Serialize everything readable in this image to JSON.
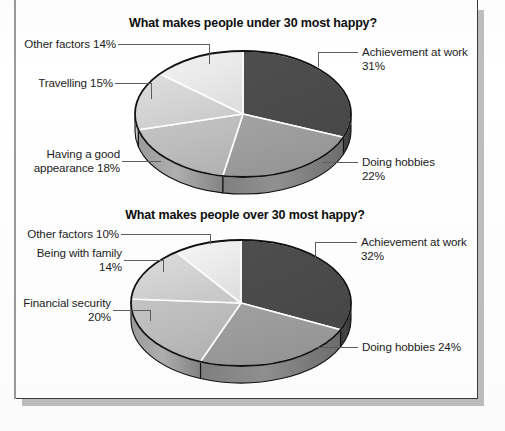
{
  "document": {
    "type": "scanned-page",
    "background_color": "#ffffff",
    "border_color": "#3a3a3a",
    "shadow_color": "#a8a8a8"
  },
  "charts": [
    {
      "id": "under-30",
      "title": "What makes people under 30 most happy?",
      "labels": {
        "achievement": "Achievement at work\n31%",
        "hobbies": "Doing hobbies\n22%",
        "appearance": "Having a good\nappearance 18%",
        "travelling": "Travelling 15%",
        "other": "Other factors 14%"
      }
    },
    {
      "id": "over-30",
      "title": "What makes people over 30 most happy?",
      "labels": {
        "achievement": "Achievement at work\n32%",
        "hobbies": "Doing hobbies 24%",
        "financial": "Financial security\n20%",
        "family": "Being with family\n14%",
        "other": "Other factors 10%"
      }
    }
  ],
  "chart_data": [
    {
      "type": "pie",
      "title": "What makes people under 30 most happy?",
      "xlabel": "",
      "ylabel": "",
      "legend_position": "callout-labels",
      "units": "percent",
      "total": 100,
      "categories": [
        "Achievement at work",
        "Doing hobbies",
        "Having a good appearance",
        "Travelling",
        "Other factors"
      ],
      "values": [
        31,
        22,
        18,
        15,
        14
      ],
      "colors": [
        "#4b4b4b",
        "#9c9c9c",
        "#bdbdbd",
        "#d4d4d4",
        "#e9e9e9"
      ],
      "start_angle_deg": 0,
      "direction": "clockwise",
      "three_d": true
    },
    {
      "type": "pie",
      "title": "What makes people over 30 most happy?",
      "xlabel": "",
      "ylabel": "",
      "legend_position": "callout-labels",
      "units": "percent",
      "total": 100,
      "categories": [
        "Achievement at work",
        "Doing hobbies",
        "Financial security",
        "Being with family",
        "Other factors"
      ],
      "values": [
        32,
        24,
        20,
        14,
        10
      ],
      "colors": [
        "#4b4b4b",
        "#9c9c9c",
        "#bdbdbd",
        "#d4d4d4",
        "#ededed"
      ],
      "start_angle_deg": 0,
      "direction": "clockwise",
      "three_d": true
    }
  ]
}
